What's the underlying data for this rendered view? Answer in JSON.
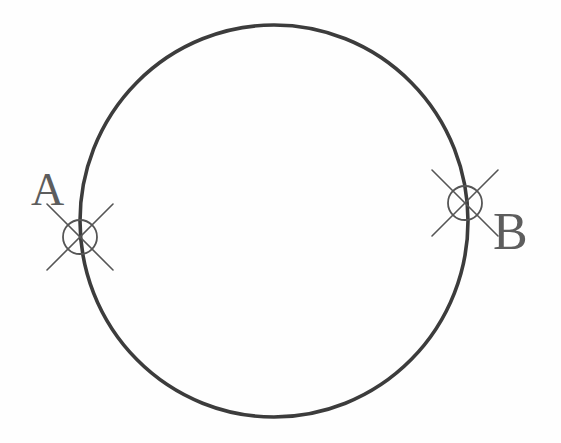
{
  "drawing": {
    "title": "Circle with two marked points",
    "background_color": "#fefefe",
    "stroke_color": "#3c3c3c",
    "label_color": "#5d5d5d",
    "main_circle": {
      "name": "main-circle",
      "center_x": 274,
      "center_y": 221,
      "radius_x": 194,
      "radius_y": 196,
      "stroke_width": 3.6
    },
    "markers": [
      {
        "id": "a",
        "label": "A",
        "name": "point-marker-a",
        "center_x": 80,
        "center_y": 237,
        "radius": 17,
        "cross_arm_length": 33,
        "stroke_width": 1.7,
        "label_x": 31,
        "label_y": 167,
        "label_size": 46
      },
      {
        "id": "b",
        "label": "B",
        "name": "point-marker-b",
        "center_x": 465,
        "center_y": 203,
        "radius": 17,
        "cross_arm_length": 33,
        "stroke_width": 1.7,
        "label_x": 493,
        "label_y": 206,
        "label_size": 52
      }
    ]
  }
}
